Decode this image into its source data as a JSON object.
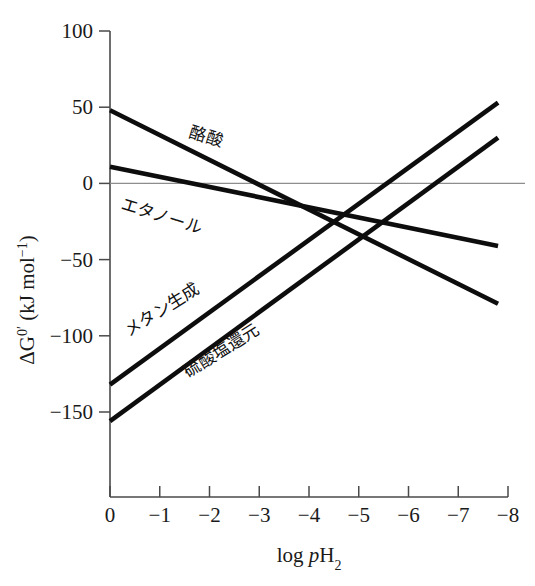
{
  "chart_data": {
    "type": "line",
    "title": "",
    "subtitle": "",
    "xlabel": "log pH2",
    "xlabel_parts": {
      "prefix": "log ",
      "italic": "p",
      "base": "H",
      "sub": "2"
    },
    "ylabel": "ΔG⁰′ (kJ mol⁻¹)",
    "ylabel_parts": {
      "delta": "ΔG",
      "sup": "0′",
      "unit": " (kJ mol",
      "unit_sup": "−1",
      "unit_close": ")"
    },
    "xlim": [
      0,
      -8
    ],
    "ylim": [
      -175,
      100
    ],
    "x_ticks": [
      0,
      -1,
      -2,
      -3,
      -4,
      -5,
      -6,
      -7,
      -8
    ],
    "x_tick_labels": [
      "0",
      "−1",
      "−2",
      "−3",
      "−4",
      "−5",
      "−6",
      "−7",
      "−8"
    ],
    "y_ticks": [
      100,
      50,
      0,
      -50,
      -100,
      -150
    ],
    "y_tick_labels": [
      "100",
      "50",
      "0",
      "−50",
      "−100",
      "−150"
    ],
    "grid": false,
    "legend": "inline-labels",
    "zero_line": true,
    "zero_line_color": "#8d8d8d",
    "line_color": "#0d0d0d",
    "series": [
      {
        "name": "酪酸",
        "name_romaji": "butyrate",
        "x": [
          0,
          -7.8
        ],
        "values": [
          48,
          -79
        ],
        "label_x": -1.9,
        "label_y": 27,
        "label_angle": 17
      },
      {
        "name": "エタノール",
        "name_romaji": "ethanol",
        "x": [
          0,
          -7.8
        ],
        "values": [
          11,
          -41
        ],
        "label_x": -1.0,
        "label_y": -25,
        "label_angle": 17
      },
      {
        "name": "メタン生成",
        "name_romaji": "methanogenesis",
        "x": [
          0,
          -7.8
        ],
        "values": [
          -132,
          53
        ],
        "label_x": -1.1,
        "label_y": -86,
        "label_angle": -32
      },
      {
        "name": "硫酸塩還元",
        "name_romaji": "sulfate reduction",
        "x": [
          0,
          -7.8
        ],
        "values": [
          -156,
          30
        ],
        "label_x": -2.3,
        "label_y": -113,
        "label_angle": -32
      }
    ]
  }
}
